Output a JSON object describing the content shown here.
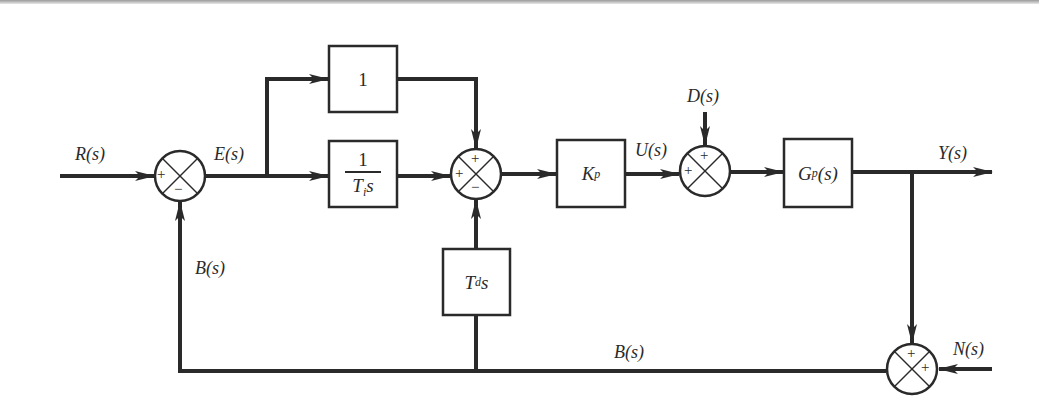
{
  "diagram": {
    "type": "PID control block diagram",
    "signals": {
      "input": "R(s)",
      "error": "E(s)",
      "control": "U(s)",
      "disturbance": "D(s)",
      "output": "Y(s)",
      "feedback_left": "B(s)",
      "feedback_bottom": "B(s)",
      "noise": "N(s)"
    },
    "blocks": {
      "proportional_path": "1",
      "integral": {
        "numerator": "1",
        "denominator_main": "T",
        "denominator_sub": "i",
        "denominator_var": "s"
      },
      "derivative": {
        "main": "T",
        "sub": "d",
        "var": "s"
      },
      "gain": {
        "main": "K",
        "sub": "p"
      },
      "plant": {
        "main": "G",
        "sub": "p",
        "arg": "(s)"
      }
    },
    "junctions": {
      "error_junction": {
        "left": "+",
        "bottom": "−"
      },
      "pid_sum": {
        "top": "+",
        "left": "+",
        "bottom": "−"
      },
      "disturbance_sum": {
        "top": "+",
        "left": "+"
      },
      "noise_sum": {
        "top": "+",
        "right": "+"
      }
    },
    "colors": {
      "line": "#2a2a2a",
      "background": "#ffffff"
    }
  }
}
